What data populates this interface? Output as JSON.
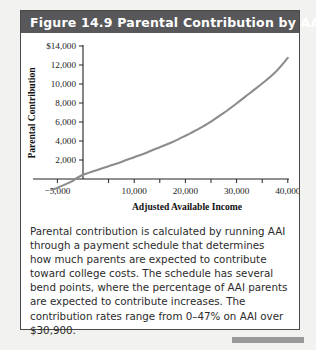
{
  "figure": {
    "title": "Figure 14.9  Parental Contribution by AAI",
    "caption": "Parental contribution is calculated by running AAI through a payment schedule that determines how much parents are expected to contribute toward college costs. The schedule has several bend points, where the percentage of AAI parents are expected to contribute increases. The contribution rates range from 0–47% on AAI over $30,900.",
    "header_color": "#58585a",
    "curve_color": "#8c8c8c",
    "border_color": "#4a4a4a",
    "page_color": "#f2f2f0"
  },
  "chart_data": {
    "type": "line",
    "title": "Figure 14.9  Parental Contribution by AAI",
    "xlabel": "Adjusted Available Income",
    "ylabel": "Parental Contribution",
    "xlim": [
      -7000,
      42000
    ],
    "ylim": [
      -2000,
      14000
    ],
    "grid": false,
    "legend": "none",
    "x_tick_labels": [
      "−5,000",
      "10,000",
      "20,000",
      "30,000",
      "40,000"
    ],
    "x_tick_values": [
      -5000,
      10000,
      20000,
      30000,
      40000
    ],
    "x_minor_tick_values": [
      -5000,
      0,
      5000,
      10000,
      15000,
      20000,
      25000,
      30000,
      35000,
      40000
    ],
    "y_tick_labels": [
      "$14,000",
      "12,000",
      "10,000",
      "8,000",
      "6,000",
      "4,000",
      "2,000"
    ],
    "y_tick_values": [
      14000,
      12000,
      10000,
      8000,
      6000,
      4000,
      2000
    ],
    "x_axis_crossing": -1500,
    "series": [
      {
        "name": "Parental contribution",
        "x": [
          -6000,
          -4000,
          -2000,
          -1500,
          0,
          2500,
          5000,
          7500,
          10000,
          12500,
          15000,
          17500,
          20000,
          22500,
          25000,
          27500,
          30000,
          32500,
          35000,
          37500,
          40000
        ],
        "y": [
          -1150,
          -700,
          -200,
          0,
          450,
          900,
          1350,
          1800,
          2300,
          2800,
          3350,
          3900,
          4550,
          5250,
          6050,
          6950,
          7950,
          9000,
          10050,
          11200,
          12750
        ]
      }
    ],
    "annotations": [
      "Contribution rates range from 0–47% on AAI over $30,900."
    ]
  }
}
